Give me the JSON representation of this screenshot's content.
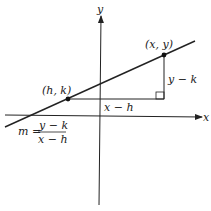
{
  "diagram": {
    "axes": {
      "x_label": "x",
      "y_label": "y"
    },
    "points": [
      {
        "label": "(h, k)",
        "name": "point-h-k"
      },
      {
        "label": "(x, y)",
        "name": "point-x-y"
      }
    ],
    "segments": {
      "horizontal_label": "x − h",
      "vertical_label": "y − k"
    },
    "formula": {
      "lhs": "m =",
      "numerator": "y − k",
      "denominator": "x − h"
    },
    "colors": {
      "ink": "#222222",
      "background": "#ffffff"
    }
  }
}
